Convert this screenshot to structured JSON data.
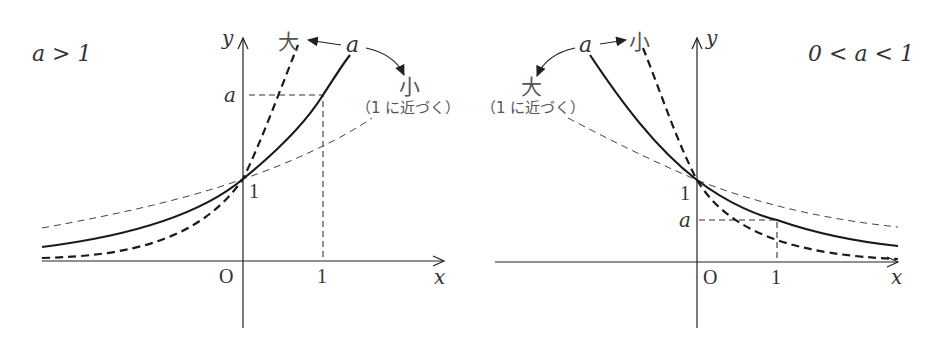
{
  "figure": {
    "left_panel": {
      "condition_label": "a > 1",
      "axis_labels": {
        "x": "x",
        "y": "y",
        "origin": "O"
      },
      "tick_labels": {
        "x_one": "1",
        "y_one": "1",
        "y_a": "a"
      },
      "annotations": {
        "a_label": "a",
        "larger_label": "大",
        "smaller_label": "小",
        "approach_one_note": "（1 に近づく）"
      },
      "curves": [
        {
          "name": "y = a^x",
          "style": "solid thick"
        },
        {
          "name": "larger a",
          "style": "dashed thick"
        },
        {
          "name": "a closer to 1",
          "style": "dashed thin"
        }
      ]
    },
    "right_panel": {
      "condition_label": "0 < a < 1",
      "axis_labels": {
        "x": "x",
        "y": "y",
        "origin": "O"
      },
      "tick_labels": {
        "x_one": "1",
        "y_one": "1",
        "y_a": "a"
      },
      "annotations": {
        "a_label": "a",
        "larger_label": "大",
        "smaller_label": "小",
        "approach_one_note": "（1 に近づく）"
      },
      "curves": [
        {
          "name": "y = a^x",
          "style": "solid thick"
        },
        {
          "name": "smaller a",
          "style": "dashed thick"
        },
        {
          "name": "a closer to 1",
          "style": "dashed thin"
        }
      ]
    }
  }
}
